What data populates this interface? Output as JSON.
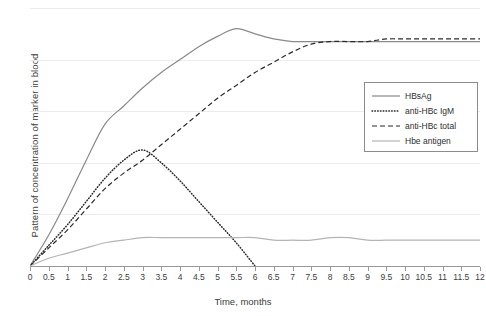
{
  "chart_data": {
    "type": "line",
    "title": "",
    "xlabel": "Time, months",
    "ylabel": "Pattern of concentration of marker in blood",
    "xlim": [
      0,
      12
    ],
    "ylim": [
      0,
      100
    ],
    "grid": true,
    "grid_lines_y": [
      20,
      40,
      60,
      80,
      100
    ],
    "legend_position": "right",
    "xticks": [
      "0",
      "0.5",
      "1",
      "1.5",
      "2",
      "2.5",
      "3",
      "3.5",
      "4",
      "4.5",
      "5",
      "5.5",
      "6",
      "6.5",
      "7",
      "7.5",
      "8",
      "8.5",
      "9",
      "9.5",
      "10",
      "10.5",
      "11",
      "11.5",
      "12"
    ],
    "xtick_values": [
      0,
      0.5,
      1,
      1.5,
      2,
      2.5,
      3,
      3.5,
      4,
      4.5,
      5,
      5.5,
      6,
      6.5,
      7,
      7.5,
      8,
      8.5,
      9,
      9.5,
      10,
      10.5,
      11,
      11.5,
      12
    ],
    "yticks": [],
    "series": [
      {
        "name": "HBsAg",
        "style": "solid",
        "color": "#8a8a8a",
        "x": [
          0,
          0.5,
          1,
          1.5,
          2,
          2.5,
          3,
          3.5,
          4,
          4.5,
          5,
          5.5,
          6,
          6.5,
          7,
          7.5,
          8,
          8.5,
          9,
          9.5,
          10,
          10.5,
          11,
          11.5,
          12
        ],
        "y": [
          0,
          12,
          26,
          41,
          55,
          62,
          69,
          75,
          80,
          85,
          89,
          92,
          90,
          88,
          87,
          87,
          87,
          87,
          87,
          87,
          87,
          87,
          87,
          87,
          87
        ]
      },
      {
        "name": "anti-HBc IgM",
        "style": "dotted",
        "color": "#2b2b2b",
        "x": [
          0,
          0.5,
          1,
          1.5,
          2,
          2.5,
          3,
          3.5,
          4,
          4.5,
          5,
          5.5,
          6
        ],
        "y": [
          0,
          8,
          16,
          25,
          34,
          41,
          45,
          40,
          33,
          25,
          17,
          9,
          0
        ]
      },
      {
        "name": "anti-HBc total",
        "style": "dashed",
        "color": "#2b2b2b",
        "x": [
          0,
          0.5,
          1,
          1.5,
          2,
          2.5,
          3,
          3.5,
          4,
          4.5,
          5,
          5.5,
          6,
          6.5,
          7,
          7.5,
          8,
          8.5,
          9,
          9.5,
          10,
          10.5,
          11,
          11.5,
          12
        ],
        "y": [
          0,
          7,
          14,
          22,
          30,
          36,
          41,
          47,
          53,
          59,
          65,
          70,
          75,
          79,
          83,
          86,
          87,
          87,
          87,
          88,
          88,
          88,
          88,
          88,
          88
        ]
      },
      {
        "name": "Hbe antigen",
        "style": "solid",
        "color": "#b4b4b4",
        "x": [
          0,
          0.5,
          1,
          1.5,
          2,
          2.5,
          3,
          3.5,
          4,
          4.5,
          5,
          5.5,
          6,
          6.5,
          7,
          7.5,
          8,
          8.5,
          9,
          9.5,
          10,
          10.5,
          11,
          11.5,
          12
        ],
        "y": [
          0,
          3,
          5,
          7,
          9,
          10,
          11,
          11,
          11,
          11,
          11,
          11,
          11,
          10,
          10,
          10,
          11,
          11,
          10,
          10,
          10,
          10,
          10,
          10,
          10
        ]
      }
    ]
  },
  "legend": {
    "items": [
      {
        "label": "HBsAg"
      },
      {
        "label": "anti-HBc IgM"
      },
      {
        "label": "anti-HBc total"
      },
      {
        "label": "Hbe antigen"
      }
    ]
  }
}
